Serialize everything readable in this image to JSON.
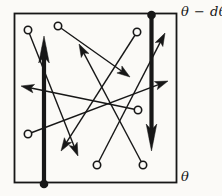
{
  "figure": {
    "type": "kinetic-theory-transport-diagram",
    "canvas": {
      "width": 222,
      "height": 196
    },
    "colors": {
      "ink": "#171717",
      "paper": "#fbfaf7"
    },
    "labels": {
      "top_plane": "θ − dθ",
      "bottom_plane": "θ"
    },
    "box": {
      "x": 14.5,
      "y": 13.5,
      "width": 162,
      "height": 169
    },
    "thick_arrows": [
      {
        "name": "flux-arrow-up-left-plane",
        "tail": [
          44,
          184
        ],
        "tip": [
          44,
          36
        ],
        "dot_r": 4.3
      },
      {
        "name": "flux-arrow-down-right-plane",
        "tail": [
          151.5,
          15
        ],
        "tip": [
          151.5,
          151
        ],
        "dot_r": 4.3
      }
    ],
    "molecule_arrows": [
      {
        "tail": [
          28,
          30
        ],
        "tip": [
          78,
          156
        ]
      },
      {
        "tail": [
          58,
          26
        ],
        "tip": [
          130,
          77
        ]
      },
      {
        "tail": [
          137,
          32
        ],
        "tip": [
          61,
          151
        ]
      },
      {
        "tail": [
          28,
          134
        ],
        "tip": [
          168,
          81
        ]
      },
      {
        "tail": [
          138,
          110
        ],
        "tip": [
          21,
          86
        ]
      },
      {
        "tail": [
          97,
          165
        ],
        "tip": [
          165,
          33
        ]
      },
      {
        "tail": [
          143,
          165
        ],
        "tip": [
          79,
          44
        ]
      }
    ],
    "circle_radius": 3.7,
    "style": {
      "thin_head_length": 13,
      "thin_head_halfwidth": 4.3,
      "thick_head_length": 27,
      "thick_head_halfwidth": 5.3
    }
  }
}
